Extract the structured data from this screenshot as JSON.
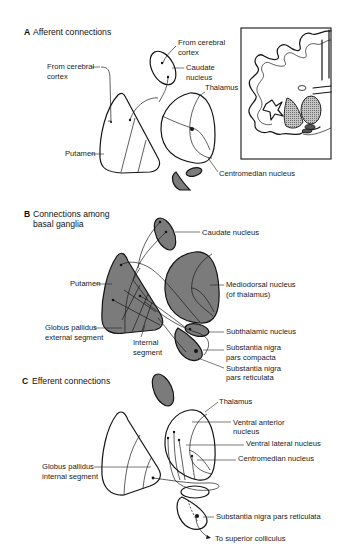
{
  "figure": {
    "colors": {
      "ink": "#141414",
      "shaded_nucleus": "#7b7b7b",
      "gradient_light": "#ffffff",
      "gradient_dark": "#8c8c8c",
      "stipple": "#a8a8a8",
      "background": "#ffffff"
    }
  },
  "panels": [
    {
      "letter": "A",
      "title": "Afferent connections",
      "labels": {
        "from_cortex_left_1": "From cerebral",
        "from_cortex_left_2": "cortex",
        "from_cortex_top_1": "From cerebral",
        "from_cortex_top_2": "cortex",
        "caudate_1": "Caudate",
        "caudate_2": "nucleus",
        "thalamus": "Thalamus",
        "putamen": "Putamen",
        "centromedian": "Centromedian nucleus"
      },
      "inset": "Coronal brain section (inset)"
    },
    {
      "letter": "B",
      "title_1": "Connections among",
      "title_2": "basal ganglia",
      "labels": {
        "caudate": "Caudate nucleus",
        "putamen": "Putamen",
        "mediodorsal_1": "Mediodorsal nucleus",
        "mediodorsal_2": "(of thalamus)",
        "gp_external_1": "Globus pallidus",
        "gp_external_2": "external segment",
        "internal_1": "Internal",
        "internal_2": "segment",
        "subthalamic": "Subthalamic nucleus",
        "sn_compacta_1": "Substantia nigra",
        "sn_compacta_2": "pars compacta",
        "sn_reticulata_1": "Substantia nigra",
        "sn_reticulata_2": "pars reticulata"
      }
    },
    {
      "letter": "C",
      "title": "Efferent connections",
      "labels": {
        "thalamus": "Thalamus",
        "ventral_anterior_1": "Ventral anterior",
        "ventral_anterior_2": "nucleus",
        "ventral_lateral": "Ventral lateral nucleus",
        "centromedian": "Centromedian nucleus",
        "gp_internal_1": "Globus pallidus",
        "gp_internal_2": "internal segment",
        "sn_reticulata": "Substantia nigra pars reticulata",
        "superior_colliculus": "To superior colliculus"
      }
    }
  ]
}
